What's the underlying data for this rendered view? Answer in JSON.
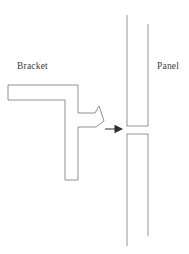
{
  "diagram": {
    "type": "technical-assembly-diagram",
    "background_color": "#ffffff",
    "line_color": "#848484",
    "arrow_color": "#2e2e2e",
    "text_color": "#3b3b3b",
    "labels": {
      "bracket": "Bracket",
      "panel": "Panel"
    },
    "parts": [
      {
        "name": "bracket",
        "label": "Bracket",
        "description": "L-shaped bracket with integral snap-fit hook tab",
        "outline_points": "8,85 78,85 78,113 95,113 99,106 104,121 96,127 78,127 78,180 65,180 65,100 8,100 8,85"
      },
      {
        "name": "panel-upper",
        "label": "Panel",
        "description": "Upper panel segment with slot edge",
        "left_edge": "127,15 127,126",
        "right_edge": "148,24 148,126",
        "bottom_edge": "127,126 148,126"
      },
      {
        "name": "panel-lower",
        "label": "Panel",
        "description": "Lower panel segment below the slot",
        "left_edge": "127,134 127,246",
        "right_edge": "148,134 148,236",
        "top_edge": "127,134 148,134"
      }
    ],
    "annotations": [
      {
        "name": "insertion-arrow",
        "kind": "arrow",
        "direction": "right",
        "meaning": "Insertion direction of bracket hook into panel slot",
        "shaft": "105,129 116,129",
        "head": "123,129 115,125 115,133"
      }
    ],
    "slot": {
      "name": "panel-slot",
      "top_y": 126,
      "bottom_y": 134,
      "gap_height": 8
    }
  }
}
